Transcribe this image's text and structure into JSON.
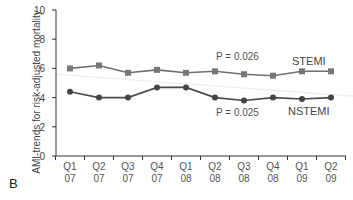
{
  "panel_label": "B",
  "chart_data": {
    "type": "line",
    "title": "",
    "xlabel": "",
    "ylabel": "AMI-trends for risk-adjusted mortality",
    "ylim": [
      0,
      10
    ],
    "yticks": [
      0,
      2,
      4,
      6,
      8,
      10
    ],
    "grid": false,
    "categories": [
      "Q1 07",
      "Q2 07",
      "Q3 07",
      "Q4 07",
      "Q1 08",
      "Q2 08",
      "Q3 08",
      "Q4 08",
      "Q1 09",
      "Q2 09"
    ],
    "category_lines": [
      [
        "Q1",
        "07"
      ],
      [
        "Q2",
        "07"
      ],
      [
        "Q3",
        "07"
      ],
      [
        "Q4",
        "07"
      ],
      [
        "Q1",
        "08"
      ],
      [
        "Q2",
        "08"
      ],
      [
        "Q3",
        "08"
      ],
      [
        "Q4",
        "08"
      ],
      [
        "Q1",
        "09"
      ],
      [
        "Q2",
        "09"
      ]
    ],
    "series": [
      {
        "name": "STEMI",
        "marker": "square",
        "color": "#707070",
        "values": [
          6.0,
          6.2,
          5.7,
          5.9,
          5.7,
          5.8,
          5.6,
          5.5,
          5.8,
          5.8
        ],
        "annotation": "P = 0.026"
      },
      {
        "name": "NSTEMI",
        "marker": "circle",
        "color": "#4a4a4a",
        "values": [
          4.4,
          4.0,
          4.0,
          4.7,
          4.7,
          4.0,
          3.8,
          4.0,
          3.9,
          4.0
        ],
        "annotation": "P = 0.025"
      }
    ],
    "legend_position": "inline-right"
  }
}
